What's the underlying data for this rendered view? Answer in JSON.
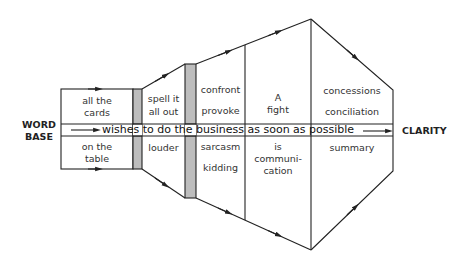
{
  "diagram": {
    "left_label": [
      "WORD",
      "BASE"
    ],
    "right_label": "CLARITY",
    "band_text": "wishes to do the business as soon as possible",
    "stages": [
      {
        "top": [
          "all the",
          "cards"
        ],
        "bottom": [
          "on the",
          "table"
        ]
      },
      {
        "top": [
          "spell it",
          "all out"
        ],
        "bottom": [
          "louder"
        ]
      },
      {
        "top": [
          "confront",
          "provoke"
        ],
        "bottom": [
          "sarcasm",
          "kidding"
        ]
      },
      {
        "top": [
          "A",
          "fight"
        ],
        "bottom": [
          "is",
          "communi-",
          "cation"
        ]
      },
      {
        "top": [
          "concessions",
          "conciliation"
        ],
        "bottom": [
          "summary"
        ]
      }
    ],
    "colors": {
      "line": "#222222",
      "bar_fill": "#bdbdbd",
      "text": "#333333"
    }
  }
}
